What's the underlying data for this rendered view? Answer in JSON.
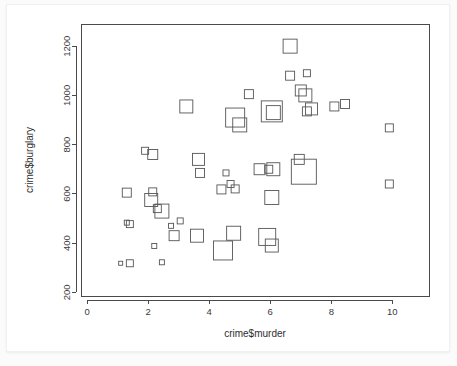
{
  "chart_data": {
    "type": "scatter",
    "title": "",
    "xlabel": "crime$murder",
    "ylabel": "crime$burglary",
    "xlim": [
      -0.2,
      11.2
    ],
    "ylim": [
      185,
      1290
    ],
    "xticks": [
      0,
      2,
      4,
      6,
      8,
      10
    ],
    "yticks": [
      200,
      400,
      600,
      800,
      1000,
      1200
    ],
    "grid": false,
    "legend": null,
    "symbol": "open-square",
    "size_encodes_third_variable": true,
    "points": [
      {
        "x": 1.1,
        "y": 318,
        "size": 4
      },
      {
        "x": 1.4,
        "y": 318,
        "size": 7
      },
      {
        "x": 1.3,
        "y": 605,
        "size": 9
      },
      {
        "x": 1.3,
        "y": 483,
        "size": 5
      },
      {
        "x": 1.4,
        "y": 477,
        "size": 7
      },
      {
        "x": 1.9,
        "y": 775,
        "size": 7
      },
      {
        "x": 2.15,
        "y": 760,
        "size": 10
      },
      {
        "x": 2.15,
        "y": 608,
        "size": 8
      },
      {
        "x": 2.1,
        "y": 575,
        "size": 13
      },
      {
        "x": 2.3,
        "y": 540,
        "size": 8
      },
      {
        "x": 2.45,
        "y": 530,
        "size": 14
      },
      {
        "x": 2.2,
        "y": 388,
        "size": 5
      },
      {
        "x": 2.45,
        "y": 322,
        "size": 5
      },
      {
        "x": 2.75,
        "y": 470,
        "size": 5
      },
      {
        "x": 2.85,
        "y": 430,
        "size": 10
      },
      {
        "x": 3.05,
        "y": 490,
        "size": 6
      },
      {
        "x": 3.25,
        "y": 955,
        "size": 13
      },
      {
        "x": 3.6,
        "y": 430,
        "size": 13
      },
      {
        "x": 3.65,
        "y": 740,
        "size": 12
      },
      {
        "x": 3.7,
        "y": 685,
        "size": 9
      },
      {
        "x": 4.4,
        "y": 618,
        "size": 9
      },
      {
        "x": 4.45,
        "y": 370,
        "size": 19
      },
      {
        "x": 4.55,
        "y": 685,
        "size": 6
      },
      {
        "x": 4.7,
        "y": 640,
        "size": 7
      },
      {
        "x": 4.8,
        "y": 440,
        "size": 14
      },
      {
        "x": 4.85,
        "y": 620,
        "size": 8
      },
      {
        "x": 4.85,
        "y": 910,
        "size": 19
      },
      {
        "x": 5.0,
        "y": 880,
        "size": 14
      },
      {
        "x": 5.3,
        "y": 1005,
        "size": 9
      },
      {
        "x": 5.65,
        "y": 700,
        "size": 11
      },
      {
        "x": 5.9,
        "y": 425,
        "size": 17
      },
      {
        "x": 5.95,
        "y": 700,
        "size": 8
      },
      {
        "x": 6.05,
        "y": 935,
        "size": 21
      },
      {
        "x": 6.05,
        "y": 390,
        "size": 13
      },
      {
        "x": 6.1,
        "y": 700,
        "size": 13
      },
      {
        "x": 6.05,
        "y": 585,
        "size": 14
      },
      {
        "x": 6.1,
        "y": 930,
        "size": 14
      },
      {
        "x": 6.65,
        "y": 1200,
        "size": 14
      },
      {
        "x": 6.65,
        "y": 1080,
        "size": 9
      },
      {
        "x": 6.95,
        "y": 740,
        "size": 10
      },
      {
        "x": 7.1,
        "y": 690,
        "size": 25
      },
      {
        "x": 7.0,
        "y": 1020,
        "size": 11
      },
      {
        "x": 7.15,
        "y": 1000,
        "size": 13
      },
      {
        "x": 7.2,
        "y": 1090,
        "size": 7
      },
      {
        "x": 7.2,
        "y": 935,
        "size": 9
      },
      {
        "x": 7.35,
        "y": 945,
        "size": 12
      },
      {
        "x": 8.1,
        "y": 955,
        "size": 9
      },
      {
        "x": 8.45,
        "y": 965,
        "size": 9
      },
      {
        "x": 9.9,
        "y": 868,
        "size": 8
      },
      {
        "x": 9.9,
        "y": 640,
        "size": 8
      }
    ]
  },
  "axes": {
    "x_tick_labels": [
      "0",
      "2",
      "4",
      "6",
      "8",
      "10"
    ],
    "y_tick_labels": [
      "200",
      "400",
      "600",
      "800",
      "1000",
      "1200"
    ],
    "x_axis_title": "crime$murder",
    "y_axis_title": "crime$burglary"
  },
  "colors": {
    "point_stroke": "#555555",
    "axis": "#4a4a4a",
    "text": "#2e2e2e",
    "card_background": "#ffffff",
    "page_background": "#fbfbfb"
  }
}
